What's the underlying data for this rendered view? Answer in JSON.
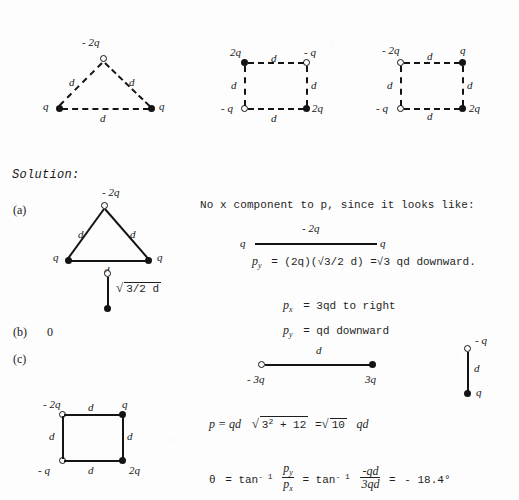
{
  "page": {
    "background_color": "#fdfdfd",
    "ink_color": "#141414"
  },
  "problem_figures": [
    {
      "id": "figure-triangle-problem",
      "shape": "equilateral-triangle",
      "vertices": [
        {
          "label": "- 2q",
          "charge_sign": "negative",
          "marker": "open-circle",
          "position": "top"
        },
        {
          "label": "q",
          "charge_sign": "positive",
          "marker": "filled-circle",
          "position": "bottom-left"
        },
        {
          "label": "q",
          "charge_sign": "positive",
          "marker": "filled-circle",
          "position": "bottom-right"
        }
      ],
      "edge_labels": [
        "d",
        "d",
        "d"
      ],
      "line_style": "dashed"
    },
    {
      "id": "figure-square-problem-1",
      "shape": "square",
      "vertices": [
        {
          "label": "2q",
          "charge_sign": "positive",
          "marker": "filled-circle",
          "position": "top-left"
        },
        {
          "label": "- q",
          "charge_sign": "negative",
          "marker": "open-circle",
          "position": "top-right"
        },
        {
          "label": "- q",
          "charge_sign": "negative",
          "marker": "open-circle",
          "position": "bottom-left"
        },
        {
          "label": "2q",
          "charge_sign": "positive",
          "marker": "filled-circle",
          "position": "bottom-right"
        }
      ],
      "edge_labels": [
        "d",
        "d",
        "d",
        "d"
      ],
      "line_style": "dashed"
    },
    {
      "id": "figure-square-problem-2",
      "shape": "square",
      "vertices": [
        {
          "label": "- 2q",
          "charge_sign": "negative",
          "marker": "open-circle",
          "position": "top-left"
        },
        {
          "label": "q",
          "charge_sign": "positive",
          "marker": "filled-circle",
          "position": "top-right"
        },
        {
          "label": "- q",
          "charge_sign": "negative",
          "marker": "open-circle",
          "position": "bottom-left"
        },
        {
          "label": "2q",
          "charge_sign": "positive",
          "marker": "filled-circle",
          "position": "bottom-right"
        }
      ],
      "edge_labels": [
        "d",
        "d",
        "d",
        "d"
      ],
      "line_style": "dashed"
    }
  ],
  "solution": {
    "heading": "Solution:",
    "parts": [
      {
        "key": "part-a",
        "label": "(a)",
        "answer": ""
      },
      {
        "key": "part-b",
        "label": "(b)",
        "answer": "0"
      },
      {
        "key": "part-c",
        "label": "(c)",
        "answer": ""
      }
    ]
  },
  "figure_a": {
    "id": "figure-triangle-solution",
    "shape": "equilateral-triangle",
    "line_style": "solid",
    "vertices": [
      {
        "label": "- 2q",
        "marker": "open-circle",
        "position": "top"
      },
      {
        "label": "q",
        "marker": "filled-circle",
        "position": "bottom-left"
      },
      {
        "label": "q",
        "marker": "filled-circle",
        "position": "bottom-right"
      }
    ],
    "edge_labels": [
      "d",
      "d",
      "d"
    ]
  },
  "figure_a_dipole": {
    "id": "figure-dipole-vertical-a",
    "top_marker": "open-circle",
    "bottom_marker": "filled-circle",
    "length_label_prefix": "",
    "length_label": "3/2  d",
    "length_label_radicand": "3",
    "length_label_full": "√3/2  d"
  },
  "notes": {
    "line1": "No x component to p, since it looks like:",
    "line1_italic_token": "x",
    "inline_figure": {
      "id": "figure-collinear-sketch",
      "left_label": "q",
      "center_label": "- 2q",
      "right_label": "q"
    },
    "py_equation": {
      "lhs_symbol": "p",
      "lhs_subscript": "y",
      "rhs": "= (2q)(√3/2  d) =√3  qd  downward."
    },
    "px_result": {
      "lhs_symbol": "p",
      "lhs_subscript": "x",
      "rhs": "= 3qd  to right"
    },
    "py_result": {
      "lhs_symbol": "p",
      "lhs_subscript": "y",
      "rhs": "= qd  downward"
    }
  },
  "figure_c_dipole_h": {
    "id": "figure-dipole-horizontal-c",
    "edge_label": "d",
    "left_label": "- 3q",
    "right_label": "3q",
    "left_marker": "open-circle",
    "right_marker": "filled-circle"
  },
  "figure_c_dipole_v": {
    "id": "figure-dipole-vertical-c",
    "edge_label": "d",
    "top_label": "- q",
    "bottom_label": "q",
    "top_marker": "open-circle",
    "bottom_marker": "filled-circle"
  },
  "figure_c_square": {
    "id": "figure-square-solution",
    "shape": "square",
    "line_style": "solid",
    "vertices": [
      {
        "label": "- 2q",
        "marker": "open-circle",
        "position": "top-left"
      },
      {
        "label": "q",
        "marker": "filled-circle",
        "position": "top-right"
      },
      {
        "label": "- q",
        "marker": "open-circle",
        "position": "bottom-left"
      },
      {
        "label": "2q",
        "marker": "filled-circle",
        "position": "bottom-right"
      }
    ],
    "edge_labels": [
      "d",
      "d",
      "d",
      "d"
    ]
  },
  "final_equations": {
    "magnitude": {
      "prefix": "p = qd",
      "radical_sign": "√",
      "radicand_base": "3",
      "radicand_exponent": "2",
      "radicand_rest": "+ 12",
      "equals": "=",
      "result_radical": "√",
      "result_radicand": "10",
      "result_suffix": "qd"
    },
    "angle": {
      "theta": "θ",
      "equals1": "= tan",
      "exponent1": "- 1",
      "frac1_num": "p",
      "frac1_num_sub": "y",
      "frac1_den": "p",
      "frac1_den_sub": "x",
      "equals2": "= tan",
      "exponent2": "- 1",
      "frac2_num": "-qd",
      "frac2_den": "3qd",
      "equals3": "=",
      "result": "- 18.4°"
    }
  }
}
